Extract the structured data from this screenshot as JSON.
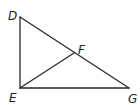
{
  "diagram": {
    "type": "geometry-triangle",
    "points": {
      "D": {
        "label": "D",
        "x": 20,
        "y": 17
      },
      "E": {
        "label": "E",
        "x": 20,
        "y": 88
      },
      "F": {
        "label": "F",
        "x": 74,
        "y": 53
      },
      "G": {
        "label": "G",
        "x": 129,
        "y": 88
      }
    },
    "segments": [
      {
        "name": "DE",
        "from": "D",
        "to": "E"
      },
      {
        "name": "EG",
        "from": "E",
        "to": "G"
      },
      {
        "name": "DG",
        "from": "D",
        "to": "G"
      },
      {
        "name": "EF",
        "from": "E",
        "to": "F"
      }
    ],
    "line_color": "#2a2a2a",
    "label_color": "#222222"
  }
}
